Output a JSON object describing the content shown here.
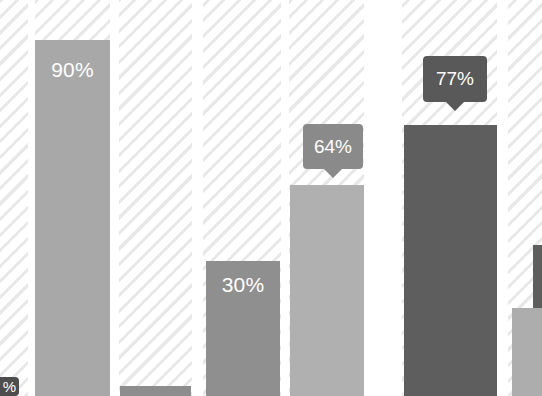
{
  "chart_data": {
    "type": "bar",
    "title": "",
    "subtitle": "",
    "xlabel": "",
    "ylabel": "",
    "ylim": [
      0,
      100
    ],
    "grid": false,
    "legend": null,
    "categories": [
      "",
      "",
      "",
      "",
      "",
      "",
      "",
      ""
    ],
    "values": [
      null,
      90,
      2,
      30,
      64,
      77,
      null,
      null
    ],
    "labels": [
      "",
      "90%",
      "",
      "30%",
      "64%",
      "77%",
      "",
      ""
    ],
    "annotations": [
      {
        "text": "64%",
        "kind": "callout",
        "series_index": 4
      },
      {
        "text": "77%",
        "kind": "callout",
        "series_index": 5
      }
    ],
    "note": "Grayscale bar chart on diagonally striped column bands; view is cropped so first and last columns are partially visible."
  },
  "colors": {
    "background": "#ffffff",
    "stripe": "#e8e8e8",
    "bar_light": "#a8a8a8",
    "bar_mid_light": "#b0b0b0",
    "bar_mid": "#8f8f8f",
    "bar_short": "#9a9a9a",
    "bar_dark": "#5e5e5e",
    "bar_edge_dark": "#6b6b6b",
    "callout_light": "#8a8a8a",
    "callout_dark": "#595959",
    "badge_dark": "#4d4d4d",
    "label_text": "#ffffff"
  },
  "bands": [
    {
      "name": "band-0",
      "left": 0,
      "width": 28
    },
    {
      "name": "band-1",
      "left": 35,
      "width": 75
    },
    {
      "name": "band-2",
      "left": 119,
      "width": 73
    },
    {
      "name": "band-3",
      "left": 203,
      "width": 78
    },
    {
      "name": "band-4",
      "left": 289,
      "width": 75
    },
    {
      "name": "band-5",
      "left": 402,
      "width": 95
    },
    {
      "name": "band-6",
      "left": 508,
      "width": 34
    }
  ],
  "bars": [
    {
      "name": "bar-0-clipped",
      "left": 0,
      "width": 10,
      "top": 388,
      "height": 8,
      "color": "#9a9a9a",
      "label": "",
      "label_top": 0
    },
    {
      "name": "bar-90",
      "left": 35,
      "width": 75,
      "top": 40,
      "height": 356,
      "color": "#a8a8a8",
      "label": "90%",
      "label_top": 18
    },
    {
      "name": "bar-short",
      "left": 120,
      "width": 71,
      "top": 386,
      "height": 10,
      "color": "#8d8d8d",
      "label": "",
      "label_top": 0
    },
    {
      "name": "bar-30",
      "left": 206,
      "width": 74,
      "top": 261,
      "height": 135,
      "color": "#8f8f8f",
      "label": "30%",
      "label_top": 12
    },
    {
      "name": "bar-64",
      "left": 290,
      "width": 74,
      "top": 185,
      "height": 211,
      "color": "#b0b0b0",
      "label": "",
      "label_top": 0
    },
    {
      "name": "bar-77",
      "left": 404,
      "width": 93,
      "top": 125,
      "height": 271,
      "color": "#5e5e5e",
      "label": "",
      "label_top": 0
    },
    {
      "name": "bar-last-clipped",
      "left": 533,
      "width": 9,
      "top": 245,
      "height": 151,
      "color": "#5e5e5e",
      "label": "",
      "label_top": 0
    },
    {
      "name": "bar-tail-clipped",
      "left": 512,
      "width": 30,
      "top": 308,
      "height": 88,
      "color": "#adadad",
      "label": "",
      "label_top": 0
    }
  ],
  "callouts": [
    {
      "name": "callout-64",
      "text": "64%",
      "left": 303,
      "top": 124,
      "width": 60,
      "height": 45,
      "color": "#8a8a8a"
    },
    {
      "name": "callout-77",
      "text": "77%",
      "left": 423,
      "top": 56,
      "width": 64,
      "height": 46,
      "color": "#595959"
    }
  ],
  "corner_badge": {
    "name": "corner-badge-clipped",
    "text": "%",
    "left": -10,
    "top": 377,
    "width": 29,
    "height": 19,
    "color": "#4d4d4d"
  }
}
